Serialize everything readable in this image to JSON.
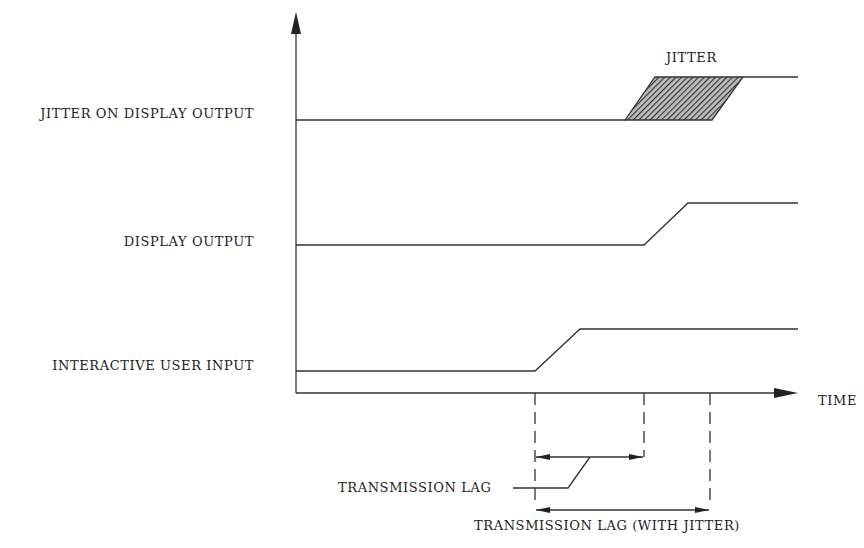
{
  "diagram": {
    "title": "",
    "signals": [
      {
        "label": "JITTER ON DISPLAY OUTPUT"
      },
      {
        "label": "DISPLAY OUTPUT"
      },
      {
        "label": "INTERACTIVE USER INPUT"
      }
    ],
    "x_axis_label": "TIME",
    "jitter_label": "JITTER",
    "annotations": {
      "transmission_lag": "TRANSMISSION LAG",
      "transmission_lag_jitter": "TRANSMISSION LAG (WITH JITTER)"
    },
    "colors": {
      "line": "#333333",
      "text": "#222222",
      "hatch": "#444444",
      "background": "#ffffff"
    }
  }
}
